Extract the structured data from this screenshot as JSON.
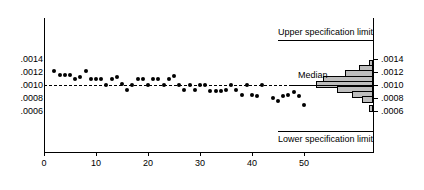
{
  "chart_data": {
    "type": "scatter",
    "title": "",
    "xlabel": "",
    "ylabel": "",
    "xlim": [
      0,
      57
    ],
    "ylim": [
      0.00045,
      0.00155
    ],
    "grid": false,
    "legend_position": "none",
    "x_ticks": [
      0,
      10,
      20,
      30,
      40,
      50
    ],
    "x_tick_labels": [
      "0",
      "10",
      "20",
      "30",
      "40",
      "50"
    ],
    "y_ticks": [
      0.0014,
      0.0012,
      0.001,
      0.0008,
      0.0006
    ],
    "y_tick_labels_left": [
      ".0014",
      ".0012",
      ".0010",
      ".0008",
      ".0006"
    ],
    "y_tick_labels_right": [
      ".0014",
      ".0012",
      ".0010",
      ".0008",
      ".0006"
    ],
    "annotations": {
      "upper_spec_limit": "Upper specification limit",
      "lower_spec_limit": "Lower specification limit",
      "median": "Median",
      "upper_spec_limit_value": 0.00145,
      "lower_spec_limit_value": 0.00055,
      "median_value": 0.001
    },
    "points": [
      {
        "x": 2,
        "y": 0.00122
      },
      {
        "x": 3,
        "y": 0.00116
      },
      {
        "x": 4,
        "y": 0.00116
      },
      {
        "x": 5,
        "y": 0.00116
      },
      {
        "x": 6,
        "y": 0.0011
      },
      {
        "x": 7,
        "y": 0.00113
      },
      {
        "x": 8,
        "y": 0.00122
      },
      {
        "x": 9,
        "y": 0.0011
      },
      {
        "x": 10,
        "y": 0.0011
      },
      {
        "x": 11,
        "y": 0.0011
      },
      {
        "x": 12,
        "y": 0.001
      },
      {
        "x": 13,
        "y": 0.0011
      },
      {
        "x": 14,
        "y": 0.00113
      },
      {
        "x": 15,
        "y": 0.00101
      },
      {
        "x": 16,
        "y": 0.00093
      },
      {
        "x": 17,
        "y": 0.001
      },
      {
        "x": 18,
        "y": 0.0011
      },
      {
        "x": 19,
        "y": 0.0011
      },
      {
        "x": 20,
        "y": 0.001
      },
      {
        "x": 21,
        "y": 0.0011
      },
      {
        "x": 22,
        "y": 0.0011
      },
      {
        "x": 23,
        "y": 0.001
      },
      {
        "x": 24,
        "y": 0.0011
      },
      {
        "x": 25,
        "y": 0.00114
      },
      {
        "x": 26,
        "y": 0.001
      },
      {
        "x": 27,
        "y": 0.00093
      },
      {
        "x": 28,
        "y": 0.001
      },
      {
        "x": 29,
        "y": 0.00093
      },
      {
        "x": 30,
        "y": 0.001
      },
      {
        "x": 31,
        "y": 0.001
      },
      {
        "x": 32,
        "y": 0.00091
      },
      {
        "x": 33,
        "y": 0.00091
      },
      {
        "x": 34,
        "y": 0.00091
      },
      {
        "x": 35,
        "y": 0.00093
      },
      {
        "x": 36,
        "y": 0.001
      },
      {
        "x": 37,
        "y": 0.00093
      },
      {
        "x": 38,
        "y": 0.00085
      },
      {
        "x": 39,
        "y": 0.001
      },
      {
        "x": 40,
        "y": 0.00084
      },
      {
        "x": 41,
        "y": 0.00083
      },
      {
        "x": 42,
        "y": 0.001
      },
      {
        "x": 44,
        "y": 0.0008
      },
      {
        "x": 45,
        "y": 0.00076
      },
      {
        "x": 46,
        "y": 0.00083
      },
      {
        "x": 47,
        "y": 0.00085
      },
      {
        "x": 48,
        "y": 0.0009
      },
      {
        "x": 49,
        "y": 0.00083
      },
      {
        "x": 50,
        "y": 0.00069
      }
    ],
    "histogram": {
      "orientation": "horizontal",
      "bin_centers": [
        0.00133,
        0.00125,
        0.00117,
        0.00109,
        0.00101,
        0.00093,
        0.00085,
        0.00077,
        0.00064
      ],
      "counts": [
        1,
        4,
        8,
        14,
        16,
        10,
        6,
        3,
        1
      ]
    }
  }
}
